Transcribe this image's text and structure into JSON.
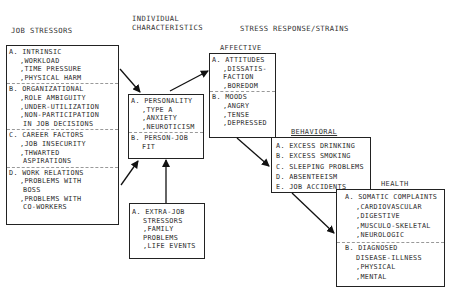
{
  "headers": {
    "job_stressors": "JOB STRESSORS",
    "individual_line1": "INDIVIDUAL",
    "individual_line2": "CHARACTERISTICS",
    "stress_response": "STRESS RESPONSE/STRAINS"
  },
  "job_stressors": {
    "sections": [
      {
        "title": "A. INTRINSIC",
        "items": [
          ",WORKLOAD",
          ",TIME PRESSURE",
          ",PHYSICAL HARM"
        ]
      },
      {
        "title": "B. ORGANIZATIONAL",
        "items": [
          ",ROLE AMBIGUITY",
          ",UNDER-UTILIZATION",
          ",NON-PARTICIPATION",
          " IN JOB DECISIONS"
        ]
      },
      {
        "title": "C. CAREER FACTORS",
        "items": [
          ",JOB INSECURITY",
          ",THWARTED",
          " ASPIRATIONS"
        ]
      },
      {
        "title": "D. WORK RELATIONS",
        "items": [
          ",PROBLEMS WITH",
          " BOSS",
          ",PROBLEMS WITH",
          " CO-WORKERS"
        ]
      }
    ]
  },
  "individual": {
    "sections": [
      {
        "title": "A. PERSONALITY",
        "items": [
          ",TYPE A",
          ",ANXIETY",
          ",NEUROTICISM"
        ]
      },
      {
        "title": "B. PERSON-JOB",
        "items": [
          " FIT"
        ]
      }
    ]
  },
  "extra_job": {
    "lines": [
      "A. EXTRA-JOB",
      "STRESSORS",
      ",FAMILY",
      " PROBLEMS",
      ",LIFE EVENTS"
    ]
  },
  "affective": {
    "label": "AFFECTIVE",
    "sections": [
      {
        "title": "A. ATTITUDES",
        "items": [
          ",DISSATIS-",
          " FACTION",
          ",BOREDOM"
        ]
      },
      {
        "title": "B. MOODS",
        "items": [
          ",ANGRY",
          ",TENSE",
          ",DEPRESSED"
        ]
      }
    ]
  },
  "behavioral": {
    "label": "BEHAVIORAL",
    "items": [
      "A. EXCESS DRINKING",
      "B. EXCESS SMOKING",
      "C. SLEEPING PROBLEMS",
      "D. ABSENTEEISM",
      "E. JOB ACCIDENTS"
    ]
  },
  "health": {
    "label": "HEALTH",
    "sections": [
      {
        "title": "A. SOMATIC COMPLAINTS",
        "items": [
          ",CARDIOVASCULAR",
          ",DIGESTIVE",
          ",MUSCULO-SKELETAL",
          ",NEUROLOGIC"
        ]
      },
      {
        "title": "B. DIAGNOSED",
        "items": [
          " DISEASE-ILLNESS",
          ",PHYSICAL",
          ",MENTAL"
        ]
      }
    ]
  }
}
